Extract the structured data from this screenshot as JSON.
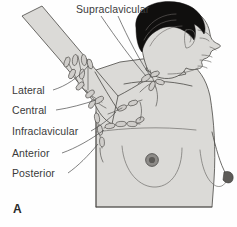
{
  "figure": {
    "panel_letter": "A",
    "caption_subject": "axillary-lymph-nodes",
    "background_color": "#fefefe",
    "body_fill_color": "#dbdad7",
    "outline_color": "#53514e",
    "hair_color": "#100f0e",
    "label_color": "#3a3a3a",
    "node_fill_color": "#cfcdca"
  },
  "labels": {
    "supraclavicular": "Supraclavicular",
    "lateral": "Lateral",
    "central": "Central",
    "infraclavicular": "Infraclavicular",
    "anterior": "Anterior",
    "posterior": "Posterior"
  },
  "node_groups": [
    {
      "name": "supraclavicular",
      "label": "Supraclavicular",
      "position": "above clavicle at base of neck"
    },
    {
      "name": "lateral",
      "label": "Lateral",
      "position": "along upper inner arm / humeral axilla"
    },
    {
      "name": "central",
      "label": "Central",
      "position": "center of axilla"
    },
    {
      "name": "infraclavicular",
      "label": "Infraclavicular",
      "position": "below clavicle"
    },
    {
      "name": "anterior",
      "label": "Anterior",
      "position": "anterior axillary fold toward breast"
    },
    {
      "name": "posterior",
      "label": "Posterior",
      "position": "posterior axillary fold"
    }
  ],
  "anatomy": [
    "head-profile-facing-right",
    "dark-hair",
    "neck",
    "raised-left-arm",
    "axilla",
    "near-breast-with-nipple",
    "far-breast-profile",
    "torso"
  ]
}
